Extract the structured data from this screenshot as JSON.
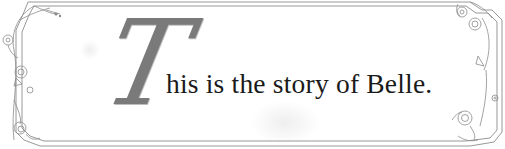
{
  "title_card": {
    "drop_cap": "T",
    "text": "his is the story of Belle.",
    "full_sentence": "This is the story of Belle."
  },
  "colors": {
    "border": "#8c8c8c",
    "drop_cap": "#7a7a7a",
    "text": "#1a1a1a",
    "background": "#ffffff"
  },
  "ornaments": {
    "left": "rose-vine-ornament",
    "right": "rose-vine-ornament"
  }
}
